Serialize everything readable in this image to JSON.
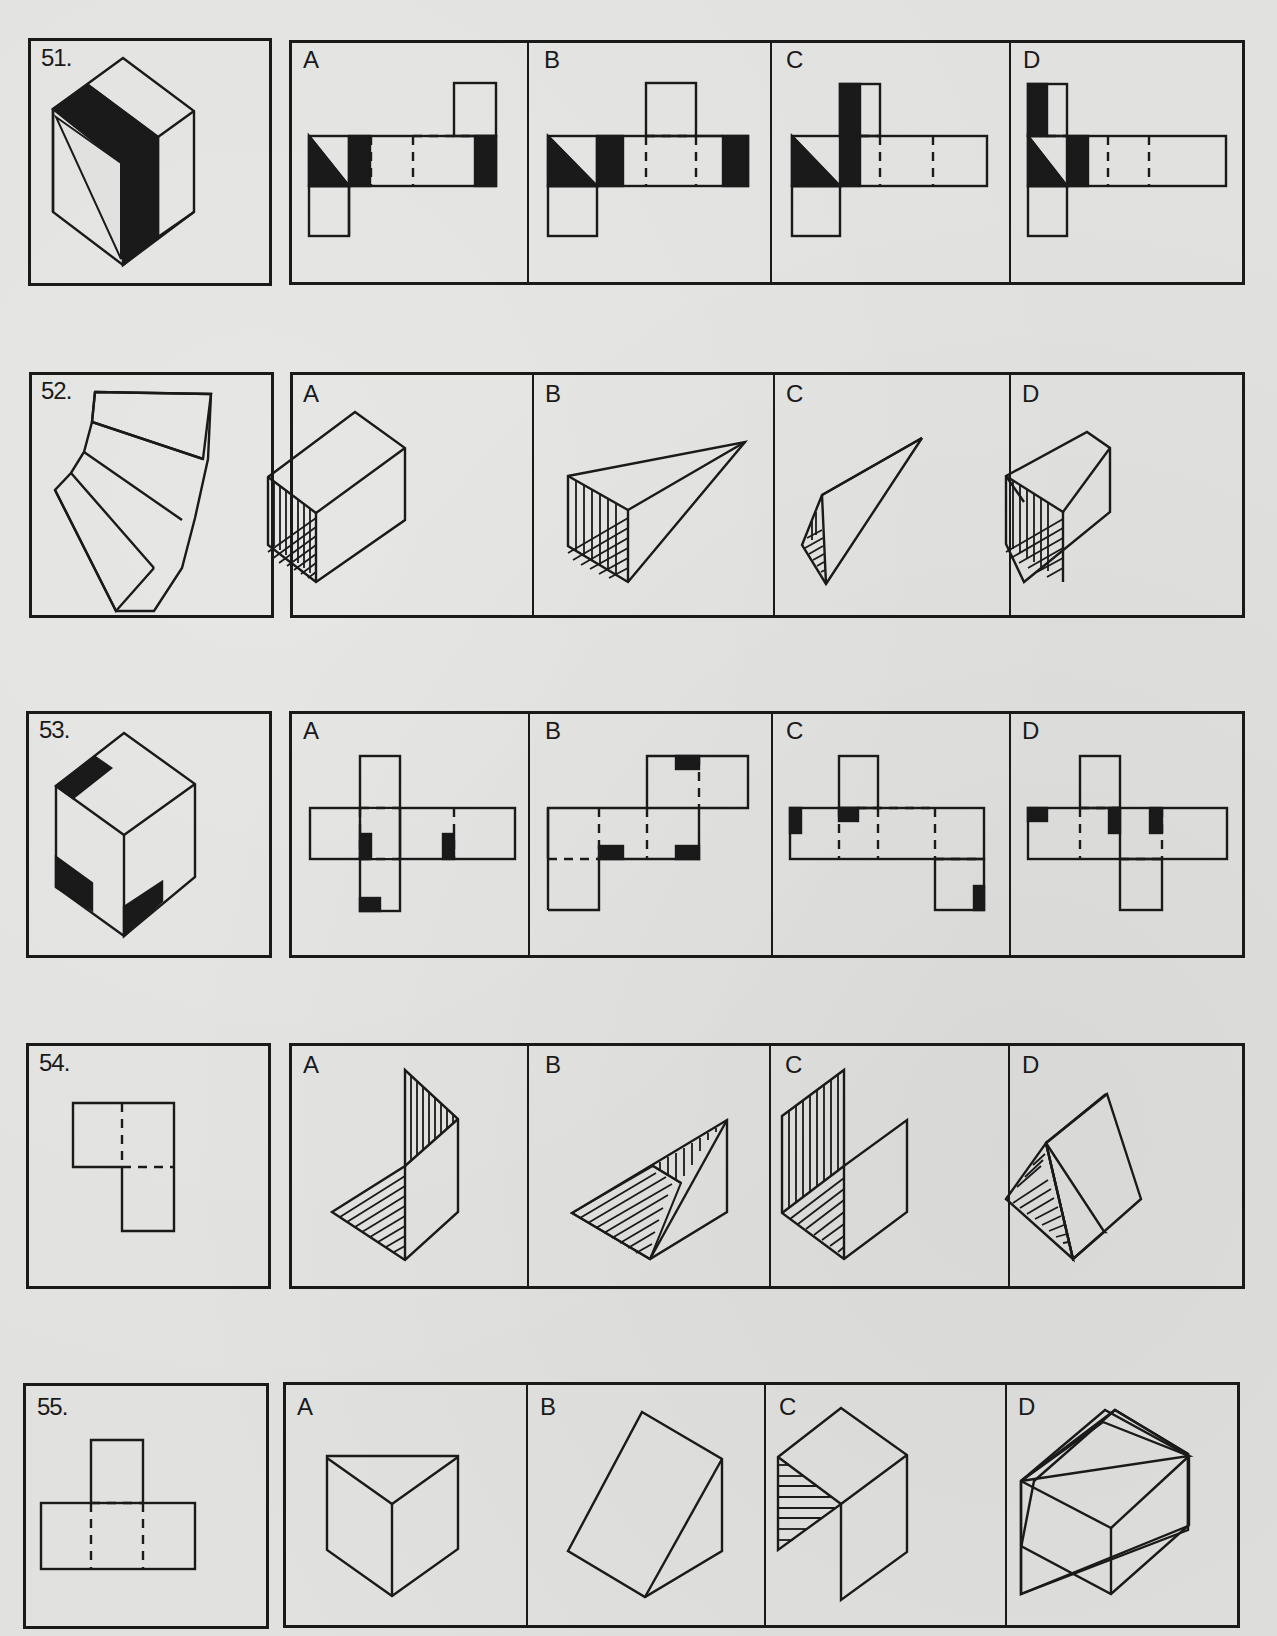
{
  "document": {
    "type": "spatial-reasoning-test-page",
    "questions": [
      {
        "number": "51.",
        "prompt_figure": "isometric cube with black faces: left face split diagonally (black triangle), middle vertical black band on front face, white top and right faces",
        "options": [
          {
            "letter": "A",
            "figure": "cube net (cross with top square at right column, bottom square at left): first square half-black diagonal, second black, dashed folds, last square black"
          },
          {
            "letter": "B",
            "figure": "cube net: first square diagonal black, second black, top flap above 4th square, last square black"
          },
          {
            "letter": "C",
            "figure": "cube net: first square diagonal black, tall black band spanning top flap and second square"
          },
          {
            "letter": "D",
            "figure": "cube net: black band on top flap left half, first square diagonal black, second square black"
          }
        ]
      },
      {
        "number": "52.",
        "prompt_figure": "fan-shaped flat pattern of four trapezoidal panels",
        "options": [
          {
            "letter": "A",
            "figure": "open rectangular box (square tube) with hatched interior"
          },
          {
            "letter": "B",
            "figure": "square pyramid tapering to a point, hatched open end"
          },
          {
            "letter": "C",
            "figure": "triangular pyramid tapering to a point, hatched open end"
          },
          {
            "letter": "D",
            "figure": "tapered square tube (frustum), hatched open end"
          }
        ]
      },
      {
        "number": "53.",
        "prompt_figure": "isometric cube with three black corner marks: top-left of top face, bottom-left of left face, bottom-left of right face",
        "options": [
          {
            "letter": "A",
            "figure": "cross-shaped cube net with black marks on two middle squares and bottom square"
          },
          {
            "letter": "B",
            "figure": "staircase cube net with black marks on three squares"
          },
          {
            "letter": "C",
            "figure": "cube net with top flap and bottom-right flap, black marks on three squares"
          },
          {
            "letter": "D",
            "figure": "cube net row of four with top and bottom flaps, black marks on three squares"
          }
        ]
      },
      {
        "number": "54.",
        "prompt_figure": "L-shaped pattern of three squares with dashed fold lines",
        "options": [
          {
            "letter": "A",
            "figure": "three panels: vertically hatched triangle upright, horizontally hatched triangle base, plain square"
          },
          {
            "letter": "B",
            "figure": "triangular wedge with hatched faces"
          },
          {
            "letter": "C",
            "figure": "three square panels forming a corner, vertical and diagonal hatching"
          },
          {
            "letter": "D",
            "figure": "triangular prism with hatched triangular end"
          }
        ]
      },
      {
        "number": "55.",
        "prompt_figure": "T-shaped pattern of four squares with dashed fold lines",
        "options": [
          {
            "letter": "A",
            "figure": "open-top three-sided corner (two walls and floor seen from above)"
          },
          {
            "letter": "B",
            "figure": "triangular wedge prism"
          },
          {
            "letter": "C",
            "figure": "cube with open front-left, hatched interior side"
          },
          {
            "letter": "D",
            "figure": "closed rectangular box"
          }
        ]
      }
    ]
  }
}
